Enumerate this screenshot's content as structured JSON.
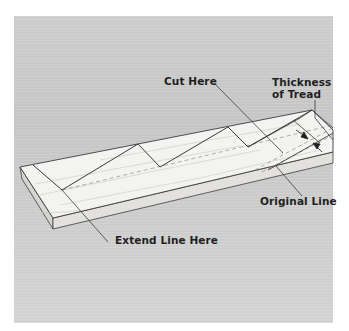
{
  "figure": {
    "colors": {
      "background": "#cccccc",
      "board_top": "#f3f3f1",
      "board_front": "#e3e2df",
      "board_end": "#d8d7d3",
      "line": "#3c3c3c",
      "dashed": "#8a8a8a",
      "label_text": "#1f1f1f"
    }
  },
  "labels": {
    "cut_here": "Cut Here",
    "thickness_of_tread": {
      "line1": "Thickness",
      "line2": "of Tread"
    },
    "original_line": "Original Line",
    "extend_line_here": "Extend Line Here"
  }
}
